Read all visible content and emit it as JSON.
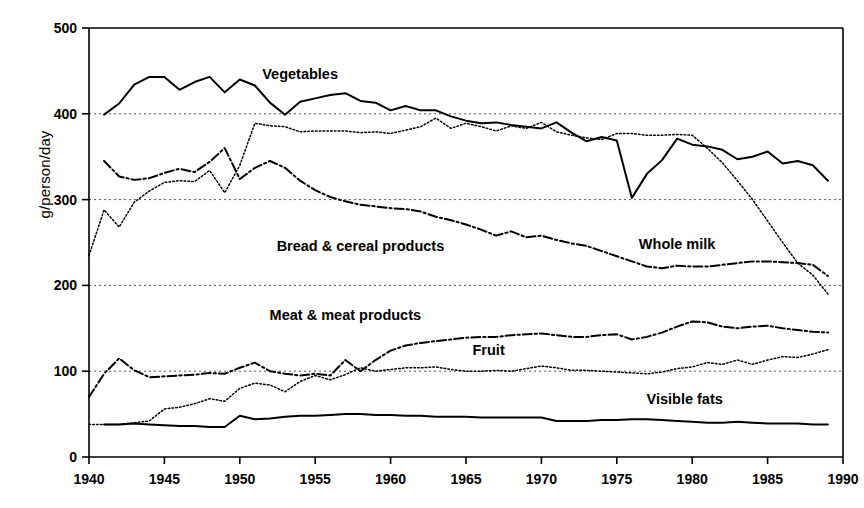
{
  "chart_data": {
    "type": "line",
    "title": "",
    "xlabel": "",
    "ylabel": "g/person/day",
    "xlim": [
      1940,
      1990
    ],
    "ylim": [
      0,
      500
    ],
    "grid": "horizontal-dashed-at-100-200-300-400",
    "legend_position": "inline-annotations",
    "xticks": [
      "1940",
      "1945",
      "1950",
      "1955",
      "1960",
      "1965",
      "1970",
      "1975",
      "1980",
      "1985",
      "1990"
    ],
    "yticks": [
      "0",
      "100",
      "200",
      "300",
      "400",
      "500"
    ],
    "x": [
      1940,
      1941,
      1942,
      1943,
      1944,
      1945,
      1946,
      1947,
      1948,
      1949,
      1950,
      1951,
      1952,
      1953,
      1954,
      1955,
      1956,
      1957,
      1958,
      1959,
      1960,
      1961,
      1962,
      1963,
      1964,
      1965,
      1966,
      1967,
      1968,
      1969,
      1970,
      1971,
      1972,
      1973,
      1974,
      1975,
      1976,
      1977,
      1978,
      1979,
      1980,
      1981,
      1982,
      1983,
      1984,
      1985,
      1986,
      1987,
      1988,
      1989
    ],
    "series": [
      {
        "name": "Vegetables",
        "style": "solid",
        "label_x": 1954.0,
        "label_y": 440,
        "values": [
          null,
          399,
          412,
          434,
          443,
          443,
          428,
          437,
          443,
          425,
          440,
          433,
          413,
          399,
          414,
          418,
          422,
          424,
          415,
          413,
          404,
          409,
          404,
          404,
          397,
          392,
          389,
          390,
          387,
          385,
          383,
          390,
          378,
          368,
          373,
          369,
          302,
          330,
          346,
          371,
          364,
          362,
          358,
          347,
          350,
          356,
          342,
          345,
          340,
          322
        ]
      },
      {
        "name": "Whole milk",
        "style": "dotted",
        "label_x": 1979.0,
        "label_y": 243,
        "values": [
          235,
          288,
          268,
          297,
          310,
          320,
          322,
          321,
          334,
          308,
          340,
          389,
          386,
          385,
          379,
          380,
          380,
          380,
          378,
          379,
          377,
          381,
          385,
          395,
          383,
          389,
          385,
          380,
          386,
          383,
          390,
          379,
          375,
          372,
          370,
          377,
          377,
          375,
          375,
          376,
          375,
          360,
          343,
          322,
          300,
          275,
          250,
          226,
          212,
          190
        ]
      },
      {
        "name": "Bread & cereal products",
        "style": "dash-dot",
        "label_x": 1958.0,
        "label_y": 240,
        "values": [
          null,
          345,
          327,
          323,
          325,
          331,
          336,
          332,
          344,
          360,
          324,
          337,
          345,
          337,
          322,
          311,
          303,
          298,
          294,
          292,
          290,
          289,
          286,
          280,
          276,
          271,
          265,
          258,
          263,
          256,
          258,
          253,
          249,
          246,
          240,
          234,
          228,
          222,
          220,
          223,
          222,
          222,
          224,
          226,
          228,
          228,
          227,
          226,
          224,
          211
        ]
      },
      {
        "name": "Meat & meat products",
        "style": "dash-dot",
        "label_x": 1957.0,
        "label_y": 160,
        "values": [
          70,
          97,
          115,
          101,
          93,
          94,
          95,
          96,
          98,
          97,
          104,
          110,
          100,
          97,
          95,
          97,
          95,
          113,
          100,
          113,
          124,
          130,
          133,
          135,
          137,
          139,
          140,
          140,
          142,
          143,
          144,
          142,
          140,
          140,
          142,
          143,
          137,
          140,
          145,
          152,
          158,
          157,
          152,
          150,
          152,
          153,
          150,
          148,
          146,
          145
        ]
      },
      {
        "name": "Fruit",
        "style": "dotted",
        "label_x": 1966.5,
        "label_y": 119,
        "values": [
          38,
          38,
          38,
          40,
          42,
          56,
          58,
          62,
          68,
          65,
          80,
          86,
          84,
          76,
          88,
          95,
          90,
          96,
          104,
          100,
          102,
          104,
          104,
          105,
          102,
          100,
          100,
          101,
          100,
          103,
          106,
          104,
          101,
          101,
          100,
          99,
          98,
          97,
          99,
          103,
          105,
          110,
          108,
          113,
          108,
          113,
          117,
          116,
          120,
          125
        ]
      },
      {
        "name": "Visible fats",
        "style": "solid",
        "label_x": 1979.5,
        "label_y": 62,
        "values": [
          null,
          38,
          38,
          39,
          38,
          37,
          36,
          36,
          35,
          35,
          48,
          44,
          45,
          47,
          48,
          48,
          49,
          50,
          50,
          49,
          49,
          48,
          48,
          47,
          47,
          47,
          46,
          46,
          46,
          46,
          46,
          42,
          42,
          42,
          43,
          43,
          44,
          44,
          43,
          42,
          41,
          40,
          40,
          41,
          40,
          39,
          39,
          39,
          38,
          38
        ]
      }
    ]
  }
}
